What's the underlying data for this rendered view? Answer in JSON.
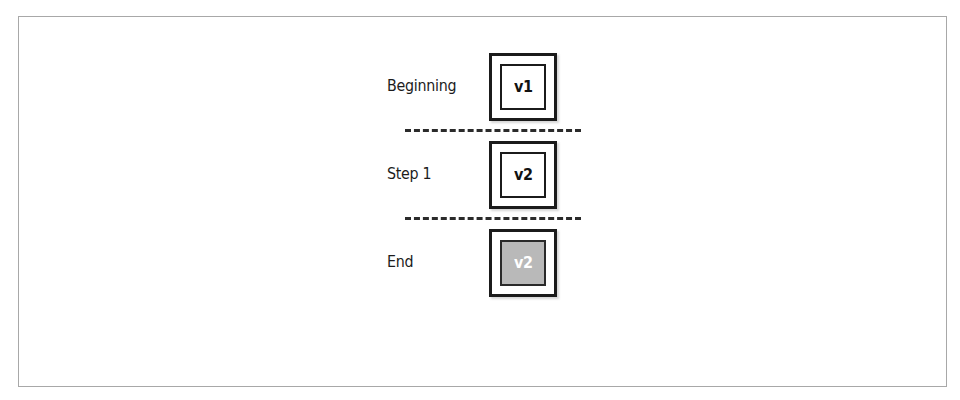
{
  "figure": {
    "type": "version-progression-diagram",
    "rows": [
      {
        "label": "Beginning",
        "box_value": "v1",
        "highlighted": false
      },
      {
        "label": "Step 1",
        "box_value": "v2",
        "highlighted": false
      },
      {
        "label": "End",
        "box_value": "v2",
        "highlighted": true
      }
    ],
    "separators": [
      {
        "style": "dashed"
      },
      {
        "style": "dashed"
      }
    ],
    "colors": {
      "frame_border": "#a8a8a8",
      "box_border": "#1b1b1b",
      "box_fill": "#ffffff",
      "highlight_fill": "#b9b9b9",
      "highlight_text": "#ffffff",
      "text": "#1c1c1c",
      "divider": "#2b2b2b",
      "background": "#ffffff"
    }
  }
}
